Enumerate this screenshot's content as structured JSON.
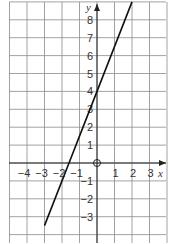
{
  "chart_data": {
    "type": "line",
    "title": "",
    "xlabel": "x",
    "ylabel": "y",
    "xlim": [
      -5,
      4
    ],
    "ylim": [
      -4,
      9
    ],
    "grid": true,
    "x_ticks": [
      -4,
      -3,
      -2,
      -1,
      1,
      2,
      3
    ],
    "y_ticks": [
      -3,
      -2,
      -1,
      1,
      2,
      3,
      4,
      5,
      6,
      7,
      8
    ],
    "origin_label": "O",
    "series": [
      {
        "name": "line",
        "equation": "y = 2.5x + 4",
        "x": [
          -3,
          -2,
          -1.6,
          -1,
          0,
          1,
          2
        ],
        "y": [
          -3.5,
          -1,
          0,
          1.5,
          4,
          6.5,
          9
        ]
      }
    ]
  },
  "labels": {
    "x_axis": "x",
    "y_axis": "y",
    "origin": "O",
    "x_ticks": [
      "−4",
      "−3",
      "−2",
      "−1",
      "1",
      "2",
      "3"
    ],
    "y_ticks": [
      "8",
      "7",
      "6",
      "5",
      "4",
      "3",
      "2",
      "1",
      "−1",
      "−2",
      "−3"
    ]
  }
}
